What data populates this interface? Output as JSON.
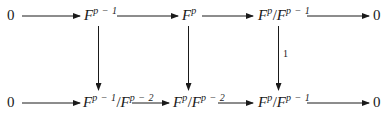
{
  "diagram": {
    "type": "commutative-diagram",
    "top_row": {
      "zero_left": "0",
      "n1": {
        "base": "F",
        "sup": "p − 1"
      },
      "n2": {
        "base": "F",
        "sup": "p"
      },
      "n3": {
        "num_base": "F",
        "num_sup": "p",
        "slash": "/",
        "den_base": "F",
        "den_sup": "p − 1"
      },
      "zero_right": "0"
    },
    "bottom_row": {
      "zero_left": "0",
      "n1": {
        "num_base": "F",
        "num_sup": "p − 1",
        "slash": "/",
        "den_base": "F",
        "den_sup": "p − 2"
      },
      "n2": {
        "num_base": "F",
        "num_sup": "p",
        "slash": "/",
        "den_base": "F",
        "den_sup": "p − 2"
      },
      "n3": {
        "num_base": "F",
        "num_sup": "p",
        "slash": "/",
        "den_base": "F",
        "den_sup": "p − 1"
      },
      "zero_right": "0"
    },
    "vertical_labels": {
      "right": "1"
    },
    "colors": {
      "ink": "#1a1a1a",
      "background": "#ffffff"
    }
  }
}
